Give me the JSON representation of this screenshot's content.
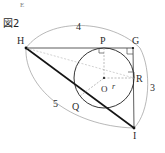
{
  "page": {
    "corner_mark": "E",
    "figure_label": "図2"
  },
  "diagram": {
    "title": "図2",
    "type": "geometry-right-triangle-with-incircle",
    "vertices": [
      {
        "id": "H",
        "label": "H",
        "x": 26,
        "y": 48
      },
      {
        "id": "G",
        "label": "G",
        "x": 133,
        "y": 48
      },
      {
        "id": "I",
        "label": "I",
        "x": 134,
        "y": 128
      }
    ],
    "tangent_points": [
      {
        "id": "P",
        "label": "P",
        "x": 104,
        "y": 48,
        "side": "HG"
      },
      {
        "id": "R",
        "label": "R",
        "x": 134,
        "y": 78,
        "side": "GI"
      },
      {
        "id": "Q",
        "label": "Q",
        "x": 76,
        "y": 101,
        "side": "HI"
      }
    ],
    "center": {
      "id": "O",
      "label": "O",
      "x": 104,
      "y": 78
    },
    "radius_label": "r",
    "radius_value": 26,
    "side_labels": [
      {
        "id": "HG",
        "label": "4",
        "x": 79,
        "y": 27
      },
      {
        "id": "GI",
        "label": "3",
        "x": 152,
        "y": 88
      },
      {
        "id": "HI",
        "label": "5",
        "x": 56,
        "y": 104
      }
    ],
    "right_angle_marks": [
      "P",
      "G",
      "R"
    ],
    "colors": {
      "stroke": "#1a1a1a",
      "thin": "#555555",
      "dashed": "#8a8a8a",
      "arc": "#8f8f8f"
    }
  }
}
